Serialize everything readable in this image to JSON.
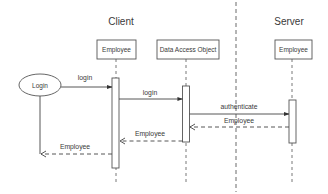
{
  "diagram": {
    "type": "UML sequence diagram",
    "sections": {
      "client": "Client",
      "server": "Server"
    },
    "actor": {
      "label": "Login",
      "shape": "ellipse"
    },
    "lifelines": [
      {
        "id": "client-employee",
        "label": "Employee",
        "section": "Client"
      },
      {
        "id": "dao",
        "label": "Data Access Object",
        "section": "Client"
      },
      {
        "id": "server-employee",
        "label": "Employee",
        "section": "Server"
      }
    ],
    "messages": [
      {
        "from": "Login",
        "to": "client-employee",
        "label": "login",
        "style": "solid"
      },
      {
        "from": "client-employee",
        "to": "dao",
        "label": "login",
        "style": "solid"
      },
      {
        "from": "dao",
        "to": "server-employee",
        "label": "authenticate",
        "style": "solid"
      },
      {
        "from": "server-employee",
        "to": "dao",
        "label": "Employee",
        "style": "dashed-return"
      },
      {
        "from": "dao",
        "to": "client-employee",
        "label": "Employee",
        "style": "dashed-return"
      },
      {
        "from": "client-employee",
        "to": "Login",
        "label": "Employee",
        "style": "dashed-return"
      }
    ],
    "colors": {
      "line": "#444444",
      "text": "#3a3a3a",
      "background": "#ffffff"
    }
  }
}
